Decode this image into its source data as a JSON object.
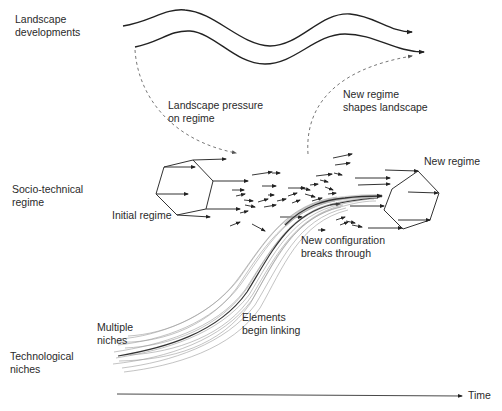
{
  "diagram": {
    "type": "multi-level perspective",
    "levels": [
      {
        "id": "landscape",
        "label_line1": "Landscape",
        "label_line2": "developments"
      },
      {
        "id": "regime",
        "label_line1": "Socio-technical",
        "label_line2": "regime"
      },
      {
        "id": "niches",
        "label_line1": "Technological",
        "label_line2": "niches"
      }
    ],
    "annotations": {
      "landscape_pressure_line1": "Landscape pressure",
      "landscape_pressure_line2": "on regime",
      "new_regime_shapes_line1": "New regime",
      "new_regime_shapes_line2": "shapes landscape",
      "initial_regime": "Initial regime",
      "new_regime": "New regime",
      "breaks_through_line1": "New configuration",
      "breaks_through_line2": "breaks through",
      "elements_linking_line1": "Elements",
      "elements_linking_line2": "begin linking",
      "multiple_niches_line1": "Multiple",
      "multiple_niches_line2": "niches"
    },
    "axis": {
      "label": "Time"
    },
    "colors": {
      "line": "#222222",
      "dashed": "#777777",
      "niche_strands": "#9a9a9a"
    }
  }
}
